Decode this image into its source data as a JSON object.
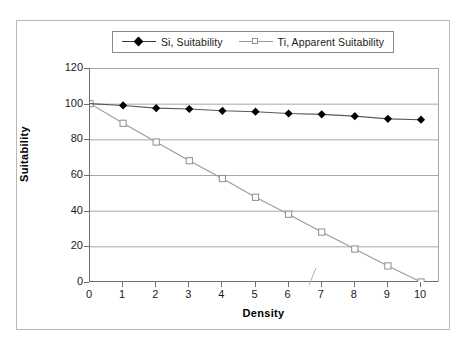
{
  "chart_data": {
    "type": "line",
    "title": "",
    "xlabel": "Density",
    "ylabel": "Suitability",
    "xlim": [
      0,
      10
    ],
    "ylim": [
      0,
      120
    ],
    "x": [
      0,
      1,
      2,
      3,
      4,
      5,
      6,
      7,
      8,
      9,
      10
    ],
    "xticks": [
      "0",
      "1",
      "2",
      "3",
      "4",
      "5",
      "6",
      "7",
      "8",
      "9",
      "10"
    ],
    "yticks": [
      "0",
      "20",
      "40",
      "60",
      "80",
      "100",
      "120"
    ],
    "ytick_values": [
      0,
      20,
      40,
      60,
      80,
      100,
      120
    ],
    "grid": "horizontal",
    "legend_position": "top-center",
    "series": [
      {
        "name": "Si, Suitability",
        "marker": "filled-diamond",
        "marker_color": "#000000",
        "line_color": "#5a5a5a",
        "values": [
          100,
          99,
          97.5,
          97,
          96,
          95.5,
          94.5,
          94,
          93,
          91.5,
          91
        ]
      },
      {
        "name": "Ti, Apparent Suitability",
        "marker": "open-square",
        "marker_color": "#ffffff",
        "marker_edge_color": "#8f8f8f",
        "line_color": "#9a9a9a",
        "values": [
          100,
          89,
          78.5,
          68,
          58,
          47.5,
          38,
          28,
          18.5,
          9,
          0
        ]
      }
    ]
  },
  "legend": {
    "entries": [
      {
        "label": "Si, Suitability",
        "marker": "filled-diamond-icon"
      },
      {
        "label": "Ti, Apparent Suitability",
        "marker": "open-square-icon"
      }
    ]
  },
  "axes": {
    "x_title": "Density",
    "y_title": "Suitability"
  },
  "colors": {
    "frame": "#b9b9b9",
    "axis": "#6e6e6e",
    "grid": "#a8a8a8",
    "si_line": "#5a5a5a",
    "si_marker": "#000000",
    "ti_line": "#9a9a9a",
    "ti_marker_edge": "#8f8f8f",
    "text": "#1a1a1a",
    "background": "#ffffff"
  }
}
